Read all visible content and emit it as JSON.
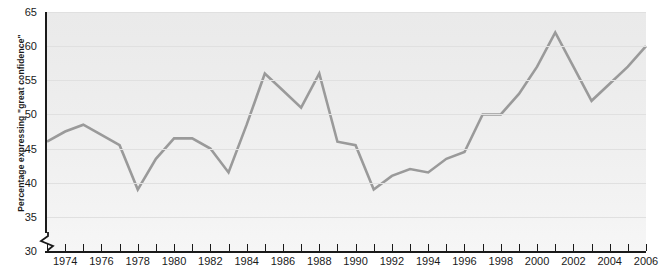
{
  "chart_data": {
    "type": "line",
    "title": "",
    "xlabel": "",
    "ylabel": "Percentage expressing \"great confidence\"",
    "xlim": [
      1973,
      2006
    ],
    "ylim": [
      30,
      65
    ],
    "ylim_note": "y-axis broken below 30",
    "grid": true,
    "legend": "none",
    "y_ticks": [
      30,
      35,
      40,
      45,
      50,
      55,
      60,
      65
    ],
    "x_ticks": [
      1973,
      1974,
      1975,
      1976,
      1977,
      1978,
      1979,
      1980,
      1981,
      1982,
      1983,
      1984,
      1985,
      1986,
      1987,
      1988,
      1989,
      1990,
      1991,
      1992,
      1993,
      1994,
      1995,
      1996,
      1997,
      1998,
      1999,
      2000,
      2001,
      2002,
      2003,
      2004,
      2005,
      2006
    ],
    "x_tick_labels": [
      "",
      "1974",
      "",
      "1976",
      "",
      "1978",
      "",
      "1980",
      "",
      "1982",
      "",
      "1984",
      "",
      "1986",
      "",
      "1988",
      "",
      "1990",
      "",
      "1992",
      "",
      "1994",
      "",
      "1996",
      "",
      "1998",
      "",
      "2000",
      "",
      "2002",
      "",
      "2004",
      "",
      "2006"
    ],
    "series_color": "#9a9a9a",
    "x": [
      1973,
      1974,
      1975,
      1976,
      1977,
      1978,
      1979,
      1980,
      1981,
      1982,
      1983,
      1984,
      1985,
      1986,
      1987,
      1988,
      1989,
      1990,
      1991,
      1992,
      1993,
      1994,
      1995,
      1996,
      1997,
      1998,
      1999,
      2000,
      2001,
      2002,
      2003,
      2004,
      2005,
      2006
    ],
    "values": [
      46,
      47.5,
      48.5,
      47,
      45.5,
      39,
      43.5,
      46.5,
      46.5,
      45,
      41.5,
      48.5,
      56,
      53.5,
      51,
      56,
      46,
      45.5,
      39,
      41,
      42,
      41.5,
      43.5,
      44.5,
      50,
      50,
      53,
      57,
      62,
      57,
      52,
      54.5,
      57,
      60
    ]
  },
  "y_axis": {
    "title": "Percentage expressing \"great confidence\"",
    "tick_labels": [
      "65",
      "60",
      "55",
      "50",
      "45",
      "40",
      "35",
      "30"
    ]
  },
  "x_axis": {
    "tick_labels": [
      "1974",
      "1976",
      "1978",
      "1980",
      "1982",
      "1984",
      "1986",
      "1988",
      "1990",
      "1992",
      "1994",
      "1996",
      "1998",
      "2000",
      "2002",
      "2004",
      "2006"
    ]
  },
  "colors": {
    "line": "#9a9a9a",
    "axis": "#1a1a1a",
    "grid": "#e0e0e0",
    "plot_background": "#efefef"
  }
}
